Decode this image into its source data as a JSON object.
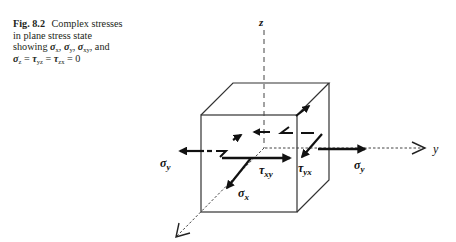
{
  "caption": {
    "figure_label": "Fig. 8.2",
    "text_line1": "Complex stresses",
    "text_line2": "in plane stress state",
    "text_line3_prefix": "showing ",
    "sym_sigma": "σ",
    "sym_tau": "τ",
    "sub_x": "x",
    "sub_y": "y",
    "sub_xy": "xy",
    "sub_z": "z",
    "sub_yz": "yz",
    "sub_zx": "zx",
    "comma": ", ",
    "and": ", and",
    "eq": " = ",
    "zero": "0"
  },
  "diagram": {
    "axis_z_label": "z",
    "axis_y_label": "y",
    "labels": {
      "sigma_y_left": "σ",
      "sigma_y_left_sub": "y",
      "sigma_y_right": "σ",
      "sigma_y_right_sub": "y",
      "tau_xy": "τ",
      "tau_xy_sub": "xy",
      "tau_yx": "τ",
      "tau_yx_sub": "yx",
      "sigma_x": "σ",
      "sigma_x_sub": "x"
    },
    "colors": {
      "ink": "#111111",
      "edge": "#333333"
    }
  }
}
